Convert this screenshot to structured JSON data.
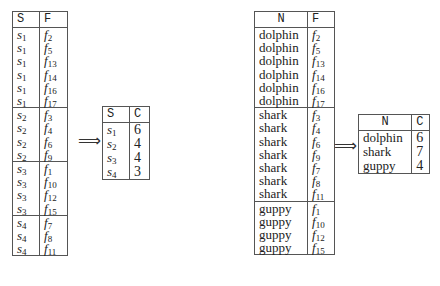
{
  "table_sf": {
    "headers": [
      "S",
      "F"
    ],
    "groups": [
      {
        "s": "s",
        "s_sub": "1",
        "rows": [
          "2",
          "5",
          "13",
          "14",
          "16",
          "17"
        ]
      },
      {
        "s": "s",
        "s_sub": "2",
        "rows": [
          "3",
          "4",
          "6",
          "9"
        ]
      },
      {
        "s": "s",
        "s_sub": "3",
        "rows": [
          "1",
          "10",
          "12",
          "15"
        ]
      },
      {
        "s": "s",
        "s_sub": "4",
        "rows": [
          "7",
          "8",
          "11"
        ]
      }
    ]
  },
  "table_sc": {
    "headers": [
      "S",
      "C"
    ],
    "rows": [
      {
        "s_sub": "1",
        "c": "6"
      },
      {
        "s_sub": "2",
        "c": "4"
      },
      {
        "s_sub": "3",
        "c": "4"
      },
      {
        "s_sub": "4",
        "c": "3"
      }
    ]
  },
  "table_nf": {
    "headers": [
      "N",
      "F"
    ],
    "groups": [
      {
        "n": "dolphin",
        "rows": [
          "2",
          "5",
          "13",
          "14",
          "16",
          "17"
        ]
      },
      {
        "n": "shark",
        "rows": [
          "3",
          "4",
          "6",
          "9",
          "7",
          "8",
          "11"
        ]
      },
      {
        "n": "guppy",
        "rows": [
          "1",
          "10",
          "12",
          "15"
        ]
      }
    ]
  },
  "table_nc": {
    "headers": [
      "N",
      "C"
    ],
    "rows": [
      {
        "n": "dolphin",
        "c": "6"
      },
      {
        "n": "shark",
        "c": "7"
      },
      {
        "n": "guppy",
        "c": "4"
      }
    ]
  },
  "arrow_symbol": "⟹"
}
